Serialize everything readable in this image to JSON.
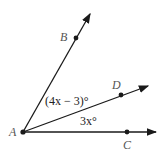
{
  "diagram": {
    "points": {
      "A": "A",
      "B": "B",
      "C": "C",
      "D": "D"
    },
    "angles": {
      "BAD": "(4x − 3)°",
      "DAC": "3x°"
    },
    "colors": {
      "stroke": "#1a1a1a",
      "label": "#555555"
    }
  }
}
